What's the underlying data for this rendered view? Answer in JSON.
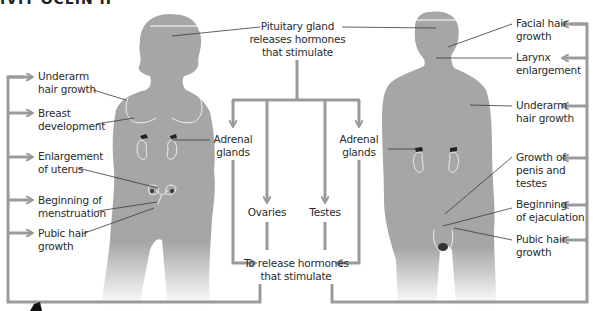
{
  "title_fragment": "IVIT OCLIN II",
  "center": {
    "pituitary": [
      "Pituitary gland",
      "releases hormones",
      "that stimulate"
    ],
    "adrenal_left": [
      "Adrenal",
      "glands"
    ],
    "adrenal_right": [
      "Adrenal",
      "glands"
    ],
    "ovaries": "Ovaries",
    "testes": "Testes",
    "release": [
      "To release hormones",
      "that stimulate"
    ]
  },
  "female": {
    "labels": [
      [
        "Underarm",
        "hair growth"
      ],
      [
        "Breast",
        "development"
      ],
      [
        "Enlargement",
        "of uterus"
      ],
      [
        "Beginning of",
        "menstruation"
      ],
      [
        "Pubic hair",
        "growth"
      ]
    ]
  },
  "male": {
    "labels": [
      [
        "Facial hair",
        "growth"
      ],
      [
        "Larynx",
        "enlargement"
      ],
      [
        "Underarm",
        "hair growth"
      ],
      [
        "Growth of",
        "penis and",
        "testes"
      ],
      [
        "Beginning",
        "of ejaculation"
      ],
      [
        "Pubic hair",
        "growth"
      ]
    ]
  },
  "colors": {
    "silhouette": "#a6a6a6",
    "arrow": "#9a9a9a",
    "leader": "#3a3a3a",
    "organ_outline": "#e8e8e8",
    "gland": "#222222"
  }
}
